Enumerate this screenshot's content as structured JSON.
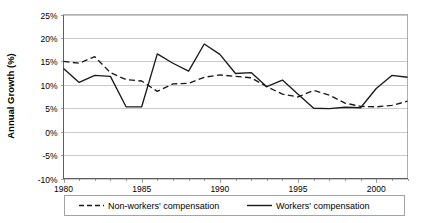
{
  "chart_data": {
    "type": "line",
    "title": "",
    "xlabel": "",
    "ylabel": "Annual Growth (%)",
    "xlim": [
      1980,
      2002
    ],
    "ylim": [
      -10,
      25
    ],
    "ytick_labels": [
      "25%",
      "20%",
      "15%",
      "10%",
      "5%",
      "0%",
      "-5%",
      "-10%"
    ],
    "ytick_values": [
      25,
      20,
      15,
      10,
      5,
      0,
      -5,
      -10
    ],
    "xtick_labels": [
      "1980",
      "1985",
      "1990",
      "1995",
      "2000"
    ],
    "xtick_values": [
      1980,
      1985,
      1990,
      1995,
      2000
    ],
    "x": [
      1980,
      1981,
      1982,
      1983,
      1984,
      1985,
      1986,
      1987,
      1988,
      1989,
      1990,
      1991,
      1992,
      1993,
      1994,
      1995,
      1996,
      1997,
      1998,
      1999,
      2000,
      2001,
      2002
    ],
    "grid": "horizontal",
    "legend_position": "bottom",
    "series": [
      {
        "name": "Non-workers' compensation",
        "style": "dashed",
        "color": "#1a1a1a",
        "values": [
          15.0,
          14.6,
          16.0,
          12.6,
          11.1,
          10.8,
          8.6,
          10.2,
          10.3,
          11.6,
          12.1,
          11.8,
          11.5,
          9.6,
          8.0,
          7.4,
          8.8,
          7.8,
          6.1,
          5.4,
          5.3,
          5.6,
          6.5
        ]
      },
      {
        "name": "Workers' compensation",
        "style": "solid",
        "color": "#1a1a1a",
        "values": [
          13.5,
          10.5,
          12.0,
          11.8,
          5.3,
          5.3,
          16.6,
          14.6,
          12.9,
          18.7,
          16.5,
          12.4,
          12.6,
          9.6,
          11.0,
          8.0,
          5.0,
          4.9,
          5.2,
          5.1,
          9.2,
          12.0,
          11.6
        ]
      }
    ],
    "series_b_tail": {
      "note": "values continue per rendered polyline"
    }
  },
  "legend": {
    "entries": [
      {
        "label": "Non-workers' compensation",
        "style": "dashed"
      },
      {
        "label": "Workers' compensation",
        "style": "solid"
      }
    ]
  },
  "axes": {
    "y_title": "Annual Growth (%)"
  }
}
